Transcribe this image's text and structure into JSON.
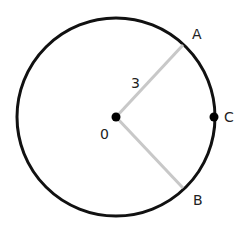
{
  "diagram": {
    "type": "circle-geometry",
    "center": {
      "label": "0",
      "x": 116,
      "y": 117
    },
    "radius_px": 99,
    "radius_label": "3",
    "points": [
      {
        "label": "A",
        "x": 183,
        "y": 45,
        "label_x": 194,
        "label_y": 38
      },
      {
        "label": "B",
        "x": 183,
        "y": 188,
        "label_x": 193,
        "label_y": 205
      },
      {
        "label": "C",
        "x": 215,
        "y": 117,
        "label_x": 225,
        "label_y": 122
      }
    ],
    "segments": [
      {
        "from": "0",
        "to": "A",
        "color": "#c8c8c8"
      },
      {
        "from": "0",
        "to": "B",
        "color": "#c8c8c8"
      }
    ],
    "colors": {
      "circle": "#111111",
      "radius_lines": "#c8c8c8",
      "dots": "#000000"
    }
  }
}
